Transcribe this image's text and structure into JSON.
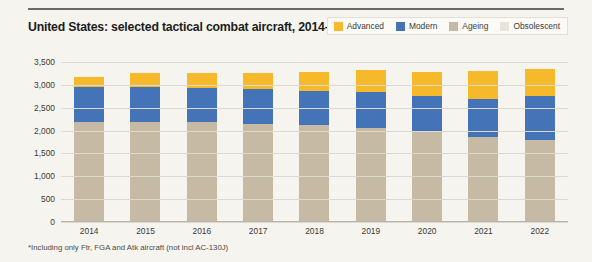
{
  "header": {
    "title": "United States: selected tactical combat aircraft, 2014–22"
  },
  "footnote": "*Including only Ftr, FGA and Atk aircraft  (not incl AC-130J)",
  "colors": {
    "advanced": "#f5b92a",
    "modern": "#4573b8",
    "ageing": "#c6baa5",
    "obsolescent": "#e8e4da",
    "background": "#f6f4ef",
    "gridline": "#ddd9d0",
    "text": "#3a3a38"
  },
  "legend": {
    "position": "top-right",
    "items": [
      {
        "label": "Advanced",
        "color": "#f5b92a",
        "swatch": "advanced-swatch"
      },
      {
        "label": "Modern",
        "color": "#4573b8",
        "swatch": "modern-swatch"
      },
      {
        "label": "Ageing",
        "color": "#c6baa5",
        "swatch": "ageing-swatch"
      },
      {
        "label": "Obsolescent",
        "color": "#e8e4da",
        "swatch": "obsolescent-swatch"
      }
    ]
  },
  "chart_data": {
    "type": "bar",
    "stacked": true,
    "title": "United States: selected tactical combat aircraft, 2014–22",
    "xlabel": "",
    "ylabel": "",
    "ylim": [
      0,
      3500
    ],
    "ytick_step": 500,
    "ytick_labels": [
      "0",
      "500",
      "1,000",
      "1,500",
      "2,000",
      "2,500",
      "3,000",
      "3,500"
    ],
    "ytick_values": [
      0,
      500,
      1000,
      1500,
      2000,
      2500,
      3000,
      3500
    ],
    "grid": true,
    "categories": [
      "2014",
      "2015",
      "2016",
      "2017",
      "2018",
      "2019",
      "2020",
      "2021",
      "2022"
    ],
    "series": [
      {
        "name": "Ageing",
        "color": "#c6baa5",
        "values": [
          2180,
          2190,
          2180,
          2150,
          2120,
          2060,
          1990,
          1860,
          1800
        ]
      },
      {
        "name": "Modern",
        "color": "#4573b8",
        "values": [
          770,
          760,
          760,
          750,
          740,
          790,
          760,
          830,
          950
        ]
      },
      {
        "name": "Advanced",
        "color": "#f5b92a",
        "values": [
          230,
          300,
          310,
          350,
          420,
          480,
          540,
          610,
          600
        ]
      },
      {
        "name": "Obsolescent",
        "color": "#e8e4da",
        "values": [
          0,
          0,
          0,
          0,
          0,
          0,
          0,
          0,
          0
        ]
      }
    ],
    "totals": [
      3180,
      3250,
      3250,
      3250,
      3280,
      3330,
      3290,
      3300,
      3350
    ]
  }
}
